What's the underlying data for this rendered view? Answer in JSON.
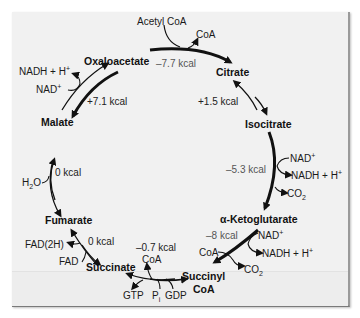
{
  "figure": {
    "type": "citric-acid-cycle",
    "compounds": {
      "oxaloacetate": "Oxaloacetate",
      "citrate": "Citrate",
      "isocitrate": "Isocitrate",
      "alpha_ketoglutarate": "α-Ketoglutarate",
      "succinyl_coa_line1": "Succinyl",
      "succinyl_coa_line2": "CoA",
      "succinate": "Succinate",
      "fumarate": "Fumarate",
      "malate": "Malate"
    },
    "energy": {
      "oxaloacetate_to_citrate": "–7.7 kcal",
      "citrate_to_isocitrate": "+1.5 kcal",
      "isocitrate_to_akg": "–5.3 kcal",
      "akg_to_succinyl_coa": "–8 kcal",
      "succinyl_coa_to_succinate": "–0.7 kcal",
      "succinate_to_fumarate": "0 kcal",
      "fumarate_to_malate": "0 kcal",
      "malate_to_oxaloacetate": "+7.1 kcal"
    },
    "cofactors": {
      "acetyl_coa": "Acetyl CoA",
      "coa_top": "CoA",
      "nad_isocitrate": "NAD",
      "nadh_isocitrate": "NADH + H",
      "co2_isocitrate": "CO",
      "nad_akg": "NAD",
      "nadh_akg": "NADH + H",
      "coa_akg": "CoA",
      "co2_akg": "CO",
      "coa_succinyl": "CoA",
      "gtp": "GTP",
      "pi": "P",
      "pi_sub": "i",
      "gdp": "GDP",
      "fad2h": "FAD(2H)",
      "fad": "FAD",
      "h2o": "H",
      "h2o_tail": "O",
      "nadh_malate": "NADH + H",
      "nad_malate": "NAD",
      "plus": "+",
      "two": "2"
    }
  }
}
